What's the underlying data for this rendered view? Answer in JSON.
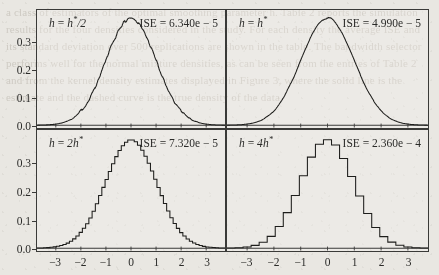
{
  "figure": {
    "type": "multi-panel-density-plot",
    "rows": 2,
    "cols": 2,
    "bleed_text": "a class of estimators of the optimal smoothing parameter h. Table 2 reports the simulation results for the four densities considered in the study. For each density the average ISE and its standard deviation over 500 replications are shown in the table. The bandwidth selector performs well for the normal mixture densities, as can be seen from the entries of Table 2 and from the kernel density estimates displayed in Figure 3, where the solid line is the estimate and the dashed curve is the true density of the data."
  },
  "axes": {
    "y_ticks": [
      "0.0",
      "0.1",
      "0.2",
      "0.3"
    ],
    "y_values": [
      0.0,
      0.1,
      0.2,
      0.3
    ],
    "y_min": -0.01,
    "y_max": 0.42,
    "x_ticks": [
      "−3",
      "−2",
      "−1",
      "0",
      "1",
      "2",
      "3"
    ],
    "x_values": [
      -3,
      -2,
      -1,
      0,
      1,
      2,
      3
    ],
    "x_min": -3.75,
    "x_max": 3.75,
    "grid": false
  },
  "colors": {
    "page_background": "#e9e7e2",
    "panel_background": "#f5f3ef",
    "axis_line": "#3a3a38",
    "curve": "#1d1d1b",
    "text": "#2b2b29",
    "bleed_text": "#c9c5bd"
  },
  "chart_data": {
    "type": "line",
    "title": "",
    "xlabel": "",
    "ylabel": "",
    "xlim": [
      -3.75,
      3.75
    ],
    "ylim": [
      -0.01,
      0.42
    ],
    "grid": false,
    "legend": "none",
    "panels": [
      {
        "id": "top-left",
        "bandwidth_label": "h = h*/2",
        "bandwidth_h": "h",
        "bandwidth_expr": "h*/2",
        "ise_label": "ISE = 6.340e − 5",
        "ise_value": 6.34e-05,
        "smoothness": "rough",
        "bin_width": 0.035,
        "noise": 0.0085,
        "peak_value": 0.39,
        "sigma": 1.0,
        "mean": 0.0
      },
      {
        "id": "top-right",
        "bandwidth_label": "h = h*",
        "bandwidth_h": "h",
        "bandwidth_expr": "h*",
        "ise_label": "ISE = 4.990e − 5",
        "ise_value": 4.99e-05,
        "smoothness": "smooth",
        "bin_width": 0.07,
        "noise": 0.0045,
        "peak_value": 0.39,
        "sigma": 1.0,
        "mean": 0.0
      },
      {
        "id": "bottom-left",
        "bandwidth_label": "h = 2h*",
        "bandwidth_h": "h",
        "bandwidth_expr": "2h*",
        "ise_label": "ISE = 7.320e − 5",
        "ise_value": 7.32e-05,
        "smoothness": "stepped-fine",
        "bin_width": 0.13,
        "noise": 0.0028,
        "peak_value": 0.385,
        "sigma": 1.02,
        "mean": 0.0
      },
      {
        "id": "bottom-right",
        "bandwidth_label": "h = 4h*",
        "bandwidth_h": "h",
        "bandwidth_expr": "4h*",
        "ise_label": "ISE = 2.360e − 4",
        "ise_value": 0.000236,
        "smoothness": "stepped-coarse",
        "bin_width": 0.3,
        "noise": 0.0035,
        "peak_value": 0.385,
        "sigma": 1.0,
        "mean": 0.0
      }
    ]
  }
}
